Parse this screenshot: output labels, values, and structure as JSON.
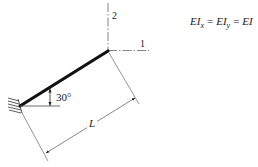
{
  "diagram": {
    "axes": {
      "axis_1_label": "1",
      "axis_2_label": "2"
    },
    "angle_label": "30°",
    "length_label": "L",
    "formula": {
      "term1_base": "EI",
      "term1_sub": "x",
      "eq1": "=",
      "term2_base": "EI",
      "term2_sub": "y",
      "eq2": "=",
      "term3": "EI"
    },
    "support": "fixed-wall",
    "colors": {
      "beam": "#111111",
      "lines": "#555555",
      "text": "#222222"
    }
  }
}
